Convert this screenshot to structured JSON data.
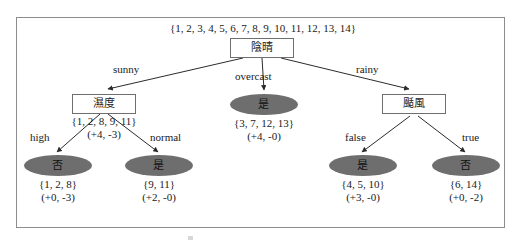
{
  "diagram": {
    "title_set": "{1, 2, 3, 4, 5, 6, 7, 8, 9, 10, 11, 12, 13, 14}",
    "colors": {
      "leaf_fill": "#6e6e6e",
      "node_border": "#6f6f6f",
      "frame_border": "#8d8d8d",
      "text": "#1a1a1a",
      "edge": "#2b2b2b"
    },
    "root": {
      "label": "陰晴",
      "set": "{1, 2, 3, 4, 5, 6, 7, 8, 9, 10, 11, 12, 13, 14}"
    },
    "nodes": {
      "humidity": {
        "label": "濕度",
        "set": "{1, 2, 8, 9, 11}",
        "counts": "(+4, -3)"
      },
      "overcast_leaf": {
        "label": "是",
        "set": "{3, 7, 12, 13}",
        "counts": "(+4, -0)"
      },
      "windy": {
        "label": "颳風",
        "set": "",
        "counts": ""
      },
      "high_leaf": {
        "label": "否",
        "set": "{1, 2, 8}",
        "counts": "(+0, -3)"
      },
      "normal_leaf": {
        "label": "是",
        "set": "{9, 11}",
        "counts": "(+2, -0)"
      },
      "false_leaf": {
        "label": "是",
        "set": "{4, 5, 10}",
        "counts": "(+3, -0)"
      },
      "true_leaf": {
        "label": "否",
        "set": "{6, 14}",
        "counts": "(+0, -2)"
      }
    },
    "edges": {
      "sunny": "sunny",
      "overcast": "overcast",
      "rainy": "rainy",
      "high": "high",
      "normal": "normal",
      "false": "false",
      "true": "true"
    }
  }
}
